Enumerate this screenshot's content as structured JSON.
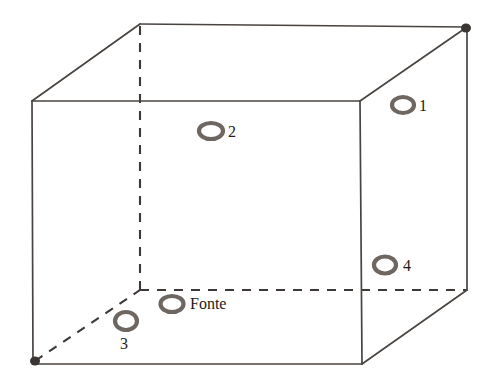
{
  "figure": {
    "type": "3d-box-room-diagram",
    "stroke_color": "#4a4440",
    "hidden_edge_color": "#3e3936",
    "marker_color": "#6e6661",
    "label_color": "#1d1a18",
    "background": "#ffffff",
    "box": {
      "front_top_left": [
        32,
        101
      ],
      "front_top_right": [
        360,
        101
      ],
      "front_bottom_left": [
        33,
        364
      ],
      "front_bottom_right": [
        362,
        364
      ],
      "back_top_left": [
        140,
        24
      ],
      "back_top_right": [
        467,
        27
      ],
      "back_bottom_left": [
        140,
        290
      ],
      "back_bottom_right": [
        467,
        290
      ]
    },
    "markers": [
      {
        "id": "1",
        "label": "1",
        "cx": 403,
        "cy": 105,
        "rx": 11,
        "ry": 8,
        "label_x": 419,
        "label_y": 98,
        "face": "right-wall"
      },
      {
        "id": "2",
        "label": "2",
        "cx": 211,
        "cy": 131,
        "rx": 12,
        "ry": 8,
        "label_x": 228,
        "label_y": 124,
        "face": "ceiling"
      },
      {
        "id": "3",
        "label": "3",
        "cx": 126,
        "cy": 321,
        "rx": 11,
        "ry": 9,
        "label_x": 120,
        "label_y": 336,
        "face": "floor"
      },
      {
        "id": "4",
        "label": "4",
        "cx": 385,
        "cy": 265,
        "rx": 11,
        "ry": 8.5,
        "label_x": 403,
        "label_y": 258,
        "face": "right-wall"
      },
      {
        "id": "fonte",
        "label": "Fonte",
        "cx": 172,
        "cy": 304,
        "rx": 11.5,
        "ry": 8,
        "label_x": 190,
        "label_y": 296,
        "face": "floor"
      }
    ],
    "corner_blobs": [
      [
        466,
        28
      ],
      [
        34,
        362
      ]
    ]
  }
}
